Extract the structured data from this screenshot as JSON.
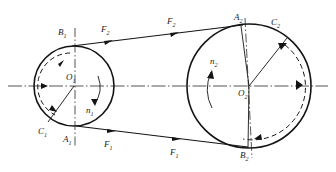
{
  "diagram": {
    "type": "mechanical-engineering-schematic",
    "colors": {
      "line": "#1a1a1a",
      "background": "#ffffff",
      "centerline": "#3a3a3a"
    },
    "pulleys": [
      {
        "id": "pulley-left",
        "center_label": "O",
        "center_sub": "1",
        "cx": 74,
        "cy": 86,
        "r": 40,
        "rotation_label": "n",
        "rotation_sub": "1",
        "rotation_direction": "clockwise",
        "points": [
          {
            "name": "B",
            "sub": "1",
            "position": "top"
          },
          {
            "name": "A",
            "sub": "1",
            "position": "bottom"
          },
          {
            "name": "C",
            "sub": "1",
            "position": "lower-left"
          }
        ]
      },
      {
        "id": "pulley-right",
        "center_label": "O",
        "center_sub": "2",
        "cx": 249,
        "cy": 86,
        "r": 62,
        "rotation_label": "n",
        "rotation_sub": "2",
        "rotation_direction": "clockwise",
        "points": [
          {
            "name": "A",
            "sub": "2",
            "position": "top"
          },
          {
            "name": "B",
            "sub": "2",
            "position": "bottom"
          },
          {
            "name": "C",
            "sub": "2",
            "position": "upper-right"
          }
        ]
      }
    ],
    "belt": {
      "upper_span": {
        "force_label": "F",
        "force_sub": "2",
        "label_count": 2,
        "direction": "left-to-right"
      },
      "lower_span": {
        "force_label": "F",
        "force_sub": "1",
        "label_count": 2,
        "direction": "left-to-right"
      }
    },
    "labels": {
      "B1": "B",
      "B1_sub": "1",
      "A1": "A",
      "A1_sub": "1",
      "C1": "C",
      "C1_sub": "1",
      "O1": "O",
      "O1_sub": "1",
      "n1": "n",
      "n1_sub": "1",
      "A2": "A",
      "A2_sub": "2",
      "B2": "B",
      "B2_sub": "2",
      "C2": "C",
      "C2_sub": "2",
      "O2": "O",
      "O2_sub": "2",
      "n2": "n",
      "n2_sub": "2",
      "F2_left": "F",
      "F2_left_sub": "2",
      "F2_right": "F",
      "F2_right_sub": "2",
      "F1_left": "F",
      "F1_left_sub": "1",
      "F1_right": "F",
      "F1_right_sub": "1"
    }
  }
}
